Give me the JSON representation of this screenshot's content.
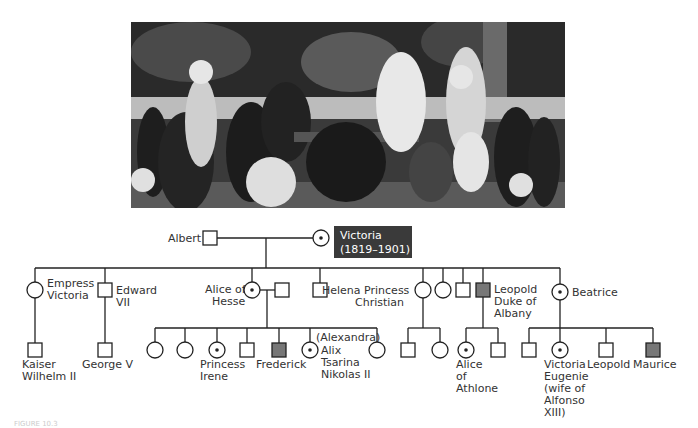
{
  "photo": {
    "description": "Sepia/black-and-white family group photograph of Queen Victoria's family seated around a table in a garden",
    "colors": {
      "bg_dark": "#2a2a2a",
      "mid": "#6b6b6b",
      "light": "#d8d8d8"
    }
  },
  "pedigree": {
    "colors": {
      "line": "#222222",
      "affected_fill": "#777777",
      "victoria_box": "#3a3a3a"
    },
    "generation1": {
      "albert": {
        "label": "Albert",
        "sex": "male",
        "status": "unaffected"
      },
      "victoria": {
        "label_line1": "Victoria",
        "label_line2": "(1819–1901)",
        "sex": "female",
        "status": "carrier"
      }
    },
    "generation2": [
      {
        "id": "empress",
        "label_lines": [
          "Empress",
          "Victoria"
        ],
        "sex": "female",
        "status": "unaffected"
      },
      {
        "id": "edward",
        "label_lines": [
          "Edward",
          "VII"
        ],
        "sex": "male",
        "status": "unaffected"
      },
      {
        "id": "alice",
        "label_lines": [
          "Alice of",
          "Hesse"
        ],
        "sex": "female",
        "status": "carrier"
      },
      {
        "id": "alice-spouse",
        "label_lines": [],
        "sex": "male",
        "status": "unaffected"
      },
      {
        "id": "son",
        "label_lines": [],
        "sex": "male",
        "status": "unaffected"
      },
      {
        "id": "helena",
        "label_lines": [
          "Helena Princess",
          "Christian"
        ],
        "sex": "female",
        "status": "unaffected"
      },
      {
        "id": "daughter",
        "label_lines": [],
        "sex": "female",
        "status": "unaffected"
      },
      {
        "id": "son2",
        "label_lines": [],
        "sex": "male",
        "status": "unaffected"
      },
      {
        "id": "leopold",
        "label_lines": [
          "Leopold",
          "Duke of",
          "Albany"
        ],
        "sex": "male",
        "status": "affected"
      },
      {
        "id": "beatrice",
        "label_lines": [
          "Beatrice"
        ],
        "sex": "female",
        "status": "carrier"
      }
    ],
    "generation3": [
      {
        "id": "wilhelm",
        "label_lines": [
          "Kaiser",
          "Wilhelm II"
        ],
        "sex": "male",
        "status": "unaffected"
      },
      {
        "id": "george",
        "label_lines": [
          "George V"
        ],
        "sex": "male",
        "status": "unaffected"
      },
      {
        "id": "hesse-d1",
        "label_lines": [],
        "sex": "female",
        "status": "unaffected"
      },
      {
        "id": "hesse-d2",
        "label_lines": [],
        "sex": "female",
        "status": "unaffected"
      },
      {
        "id": "irene",
        "label_lines": [
          "Princess",
          "Irene"
        ],
        "sex": "female",
        "status": "carrier"
      },
      {
        "id": "hesse-s1",
        "label_lines": [],
        "sex": "male",
        "status": "unaffected"
      },
      {
        "id": "frederick",
        "label_lines": [
          "Frederick"
        ],
        "sex": "male",
        "status": "affected"
      },
      {
        "id": "alix",
        "label_lines": [
          "(Alexandra)",
          "Alix",
          "Tsarina",
          "Nikolas II"
        ],
        "sex": "female",
        "status": "carrier"
      },
      {
        "id": "hesse-d3",
        "label_lines": [],
        "sex": "female",
        "status": "unaffected"
      },
      {
        "id": "helena-s",
        "label_lines": [],
        "sex": "male",
        "status": "unaffected"
      },
      {
        "id": "helena-d",
        "label_lines": [],
        "sex": "female",
        "status": "unaffected"
      },
      {
        "id": "alice-athlone",
        "label_lines": [
          "Alice",
          "of",
          "Athlone"
        ],
        "sex": "female",
        "status": "carrier"
      },
      {
        "id": "leopold-s",
        "label_lines": [],
        "sex": "male",
        "status": "unaffected"
      },
      {
        "id": "beatrice-s1",
        "label_lines": [],
        "sex": "male",
        "status": "unaffected"
      },
      {
        "id": "victoria-eugenie",
        "label_lines": [
          "Victoria",
          "Eugenie",
          "(wife of",
          "Alfonso",
          "XIII)"
        ],
        "sex": "female",
        "status": "carrier"
      },
      {
        "id": "beatrice-leopold",
        "label_lines": [
          "Leopold"
        ],
        "sex": "male",
        "status": "unaffected"
      },
      {
        "id": "maurice",
        "label_lines": [
          "Maurice"
        ],
        "sex": "male",
        "status": "affected"
      }
    ]
  },
  "caption": "FIGURE 10.3"
}
